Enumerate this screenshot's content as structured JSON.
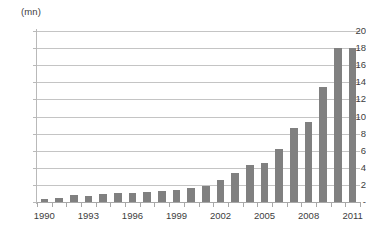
{
  "chart_data": {
    "type": "bar",
    "title": "",
    "subtitle": "",
    "unit_label": "(mn)",
    "xlabel": "",
    "ylabel": "",
    "ylim": [
      0,
      20
    ],
    "y_ticks": [
      "-",
      "2",
      "4",
      "6",
      "8",
      "10",
      "12",
      "14",
      "16",
      "18",
      "20"
    ],
    "y_tick_values": [
      0,
      2,
      4,
      6,
      8,
      10,
      12,
      14,
      16,
      18,
      20
    ],
    "grid": true,
    "legend": "none",
    "x_tick_labels": [
      "1990",
      "1993",
      "1996",
      "1999",
      "2002",
      "2005",
      "2008",
      "2011"
    ],
    "x_tick_label_step": 3,
    "categories": [
      "1990",
      "1991",
      "1992",
      "1993",
      "1994",
      "1995",
      "1996",
      "1997",
      "1998",
      "1999",
      "2000",
      "2001",
      "2002",
      "2003",
      "2004",
      "2005",
      "2006",
      "2007",
      "2008",
      "2009",
      "2010",
      "2011"
    ],
    "values": [
      0.3,
      0.5,
      0.8,
      0.7,
      0.9,
      1.0,
      1.1,
      1.2,
      1.3,
      1.4,
      1.6,
      1.9,
      2.6,
      3.4,
      4.3,
      4.6,
      6.2,
      8.6,
      9.4,
      13.4,
      18.0,
      18.0
    ],
    "series": [
      {
        "name": "",
        "color": "#808080",
        "values": [
          0.3,
          0.5,
          0.8,
          0.7,
          0.9,
          1.0,
          1.1,
          1.2,
          1.3,
          1.4,
          1.6,
          1.9,
          2.6,
          3.4,
          4.3,
          4.6,
          6.2,
          8.6,
          9.4,
          13.4,
          18.0,
          18.0
        ]
      }
    ],
    "colors": {
      "bar": "#808080",
      "gridline": "#c4c4c4",
      "axis": "#a8a8a8",
      "text": "#3d3d3d",
      "background": "#ffffff"
    }
  }
}
